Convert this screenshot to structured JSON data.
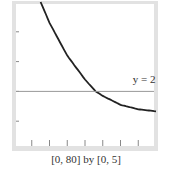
{
  "chart_data": {
    "type": "line",
    "title": "",
    "caption": "[0, 80] by [0, 5]",
    "xlabel": "",
    "ylabel": "",
    "xlim": [
      0,
      80
    ],
    "ylim": [
      0,
      5
    ],
    "x_ticks": [
      10,
      20,
      30,
      40,
      50,
      60,
      70
    ],
    "y_ticks": [
      1,
      2,
      3,
      4
    ],
    "grid": false,
    "series": [
      {
        "name": "decaying curve",
        "x": [
          15,
          20,
          30,
          40,
          46,
          50,
          60,
          70,
          80
        ],
        "values": [
          5.0,
          4.3,
          3.2,
          2.4,
          2.0,
          1.85,
          1.55,
          1.4,
          1.33
        ],
        "color": "#222222"
      },
      {
        "name": "y = 2",
        "x": [
          0,
          80
        ],
        "values": [
          2,
          2
        ],
        "color": "#999999"
      }
    ],
    "annotations": [
      {
        "text": "y = 2",
        "x": 68,
        "y": 2.2
      }
    ]
  }
}
